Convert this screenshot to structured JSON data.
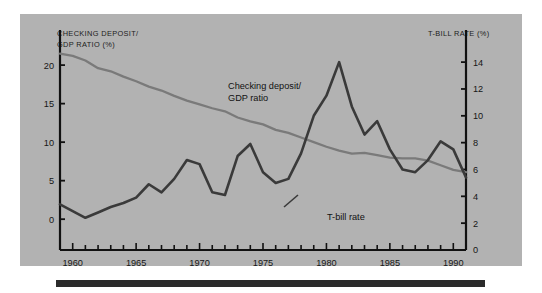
{
  "figure": {
    "panel_color": "#b2b2b2",
    "axis_color": "#111111",
    "deposit_series_color": "#7a7a7a",
    "tbill_series_color": "#3a3a3a"
  },
  "left_axis": {
    "title": "CHECKING DEPOSIT/\nGDP RATIO (%)",
    "ticks": [
      "0",
      "5",
      "10",
      "15",
      "20"
    ]
  },
  "right_axis": {
    "title": "T-BILL RATE (%)",
    "ticks": [
      "0",
      "2",
      "4",
      "6",
      "8",
      "10",
      "12",
      "14"
    ]
  },
  "x_axis": {
    "ticks": [
      "1960",
      "1965",
      "1970",
      "1975",
      "1980",
      "1985",
      "1990"
    ]
  },
  "annotations": {
    "deposit_label": "Checking deposit/\nGDP ratio",
    "tbill_label": "T-bill rate"
  },
  "chart_data": {
    "type": "line",
    "title": "",
    "xlabel": "",
    "ylabel": "CHECKING DEPOSIT/ GDP RATIO (%)",
    "y2label": "T-BILL RATE (%)",
    "grid": false,
    "legend": "inline-annotations",
    "xlim": [
      1959,
      1991
    ],
    "ylim": [
      -4,
      23
    ],
    "y2lim": [
      0,
      15.5
    ],
    "xticks": [
      1960,
      1965,
      1970,
      1975,
      1980,
      1985,
      1990
    ],
    "xtick_minor_step": 1,
    "yticks": [
      0,
      5,
      10,
      15,
      20
    ],
    "y2ticks": [
      0,
      2,
      4,
      6,
      8,
      10,
      12,
      14
    ],
    "x": [
      1959,
      1960,
      1961,
      1962,
      1963,
      1964,
      1965,
      1966,
      1967,
      1968,
      1969,
      1970,
      1971,
      1972,
      1973,
      1974,
      1975,
      1976,
      1977,
      1978,
      1979,
      1980,
      1981,
      1982,
      1983,
      1984,
      1985,
      1986,
      1987,
      1988,
      1989,
      1990,
      1991
    ],
    "series": [
      {
        "name": "Checking deposit/GDP ratio",
        "axis": "left",
        "unit": "%",
        "color": "#7a7a7a",
        "values": [
          21.5,
          21.2,
          20.6,
          19.6,
          19.2,
          18.5,
          17.9,
          17.2,
          16.7,
          16.0,
          15.4,
          14.9,
          14.4,
          14.0,
          13.2,
          12.7,
          12.3,
          11.6,
          11.2,
          10.6,
          10.0,
          9.4,
          8.9,
          8.5,
          8.6,
          8.3,
          8.0,
          7.9,
          7.9,
          7.6,
          7.0,
          6.4,
          6.1
        ]
      },
      {
        "name": "T-bill rate",
        "axis": "right",
        "unit": "%",
        "color": "#3a3a3a",
        "values": [
          3.4,
          2.9,
          2.4,
          2.8,
          3.2,
          3.5,
          3.9,
          4.9,
          4.3,
          5.3,
          6.7,
          6.4,
          4.3,
          4.1,
          7.0,
          7.9,
          5.8,
          5.0,
          5.3,
          7.2,
          10.0,
          11.5,
          14.0,
          10.7,
          8.6,
          9.6,
          7.5,
          6.0,
          5.8,
          6.7,
          8.1,
          7.5,
          5.4
        ]
      }
    ]
  }
}
